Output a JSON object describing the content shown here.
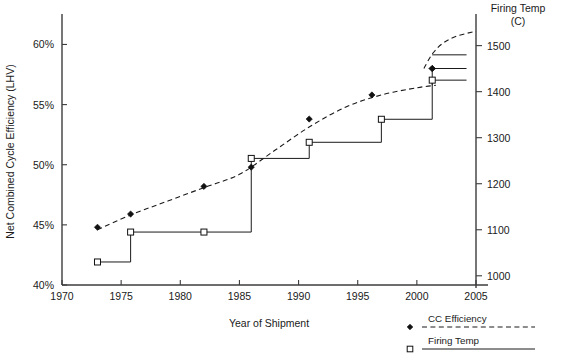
{
  "chart_data": {
    "type": "line",
    "title": "",
    "xlabel": "Year of Shipment",
    "ylabel": "Net Combined Cycle Efficiency (LHV)",
    "y2label": "Firing Temp (C)",
    "y2label_line1": "Firing Temp",
    "y2label_line2": "(C)",
    "xlim": [
      1970,
      2005
    ],
    "ylim": [
      40,
      62.2
    ],
    "y2lim": [
      980,
      1560
    ],
    "grid": false,
    "legend_position": "bottom-right",
    "xticks": [
      1970,
      1975,
      1980,
      1985,
      1990,
      1995,
      2000,
      2005
    ],
    "xticklabels": [
      "1970",
      "1975",
      "1980",
      "1985",
      "1990",
      "1995",
      "2000",
      "2005"
    ],
    "yticks": [
      40,
      45,
      50,
      55,
      60
    ],
    "yticklabels": [
      "40%",
      "45%",
      "50%",
      "55%",
      "60%"
    ],
    "y2ticks": [
      1000,
      1100,
      1200,
      1300,
      1400,
      1500
    ],
    "y2ticklabels": [
      "1000",
      "1100",
      "1200",
      "1300",
      "1400",
      "1500"
    ],
    "series": [
      {
        "name": "CC Efficiency",
        "axis": "left",
        "style": "dashed",
        "marker": "filled-diamond",
        "points": [
          {
            "x": 1973.0,
            "y": 44.8
          },
          {
            "x": 1975.8,
            "y": 45.9
          },
          {
            "x": 1982.0,
            "y": 48.2
          },
          {
            "x": 1986.0,
            "y": 49.8
          },
          {
            "x": 1990.9,
            "y": 53.8
          },
          {
            "x": 1996.2,
            "y": 55.8
          },
          {
            "x": 2001.3,
            "y": 58.0
          }
        ],
        "trend": [
          {
            "x": 1973.0,
            "y": 44.6
          },
          {
            "x": 1976.0,
            "y": 45.9
          },
          {
            "x": 1979.0,
            "y": 47.0
          },
          {
            "x": 1982.0,
            "y": 48.1
          },
          {
            "x": 1985.0,
            "y": 49.2
          },
          {
            "x": 1988.0,
            "y": 51.2
          },
          {
            "x": 1991.0,
            "y": 53.2
          },
          {
            "x": 1994.0,
            "y": 54.8
          },
          {
            "x": 1997.0,
            "y": 55.8
          },
          {
            "x": 2000.0,
            "y": 56.4
          },
          {
            "x": 2001.6,
            "y": 56.6
          }
        ],
        "trend_projection": [
          {
            "x": 2000.6,
            "y": 58.0
          },
          {
            "x": 2001.3,
            "y": 59.2
          },
          {
            "x": 2002.2,
            "y": 60.1
          },
          {
            "x": 2003.4,
            "y": 60.7
          },
          {
            "x": 2005.0,
            "y": 61.1
          }
        ]
      },
      {
        "name": "Firing Temp",
        "axis": "right",
        "style": "solid-step",
        "marker": "open-square",
        "points": [
          {
            "x": 1973.0,
            "y": 1030
          },
          {
            "x": 1975.8,
            "y": 1095
          },
          {
            "x": 1982.0,
            "y": 1095
          },
          {
            "x": 1986.0,
            "y": 1255
          },
          {
            "x": 1990.9,
            "y": 1290
          },
          {
            "x": 1997.0,
            "y": 1340
          },
          {
            "x": 2001.3,
            "y": 1425
          }
        ],
        "step_path": [
          {
            "x": 1973.0,
            "y": 1030
          },
          {
            "x": 1975.8,
            "y": 1030
          },
          {
            "x": 1975.8,
            "y": 1095
          },
          {
            "x": 1986.0,
            "y": 1095
          },
          {
            "x": 1986.0,
            "y": 1255
          },
          {
            "x": 1990.9,
            "y": 1255
          },
          {
            "x": 1990.9,
            "y": 1290
          },
          {
            "x": 1997.0,
            "y": 1290
          },
          {
            "x": 1997.0,
            "y": 1340
          },
          {
            "x": 2001.3,
            "y": 1340
          },
          {
            "x": 2001.3,
            "y": 1425
          },
          {
            "x": 2004.2,
            "y": 1425
          }
        ],
        "final_marker_tail": [
          {
            "x": 2001.3,
            "y": 1480
          },
          {
            "x": 2004.2,
            "y": 1480
          }
        ]
      }
    ]
  },
  "legend": {
    "items": [
      {
        "label": "CC Efficiency",
        "marker": "filled-diamond",
        "line": "dashed"
      },
      {
        "label": "Firing Temp",
        "marker": "open-square",
        "line": "solid"
      }
    ]
  },
  "colors": {
    "axis": "#3c3c3c",
    "ink": "#1a1a1a",
    "marker_fill": "#111111",
    "background": "#ffffff"
  }
}
